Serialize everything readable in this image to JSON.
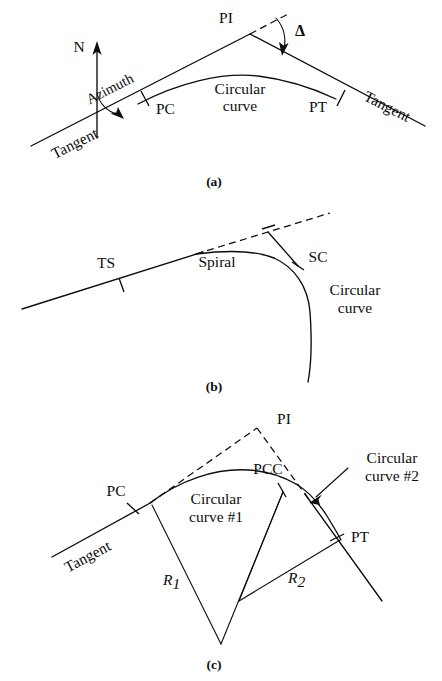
{
  "figure": {
    "ink_color": "#0d0d0d",
    "background_color": "#ffffff",
    "panels": [
      {
        "id": "a",
        "caption": "(a)",
        "description": "Simple circular curve with back tangent, forward tangent, azimuth from north, and deflection angle Delta at the PI",
        "labels": {
          "north": "N",
          "azimuth": "Azimuth",
          "tangent_back": "Tangent",
          "tangent_forward": "Tangent",
          "pc": "PC",
          "pi": "PI",
          "pt": "PT",
          "delta": "Δ",
          "curve_line1": "Circular",
          "curve_line2": "curve"
        }
      },
      {
        "id": "b",
        "caption": "(b)",
        "description": "Spiral transition curve from tangent to circular curve, with TS and SC points",
        "labels": {
          "ts": "TS",
          "spiral": "Spiral",
          "sc": "SC",
          "curve_line1": "Circular",
          "curve_line2": "curve"
        }
      },
      {
        "id": "c",
        "caption": "(c)",
        "description": "Compound circular curve with two radii R1 and R2 joined at the PCC",
        "labels": {
          "tangent": "Tangent",
          "pc": "PC",
          "pi": "PI",
          "pcc": "PCC",
          "pt": "PT",
          "curve1_line1": "Circular",
          "curve1_line2": "curve #1",
          "curve2_line1": "Circular",
          "curve2_line2": "curve #2",
          "radius1": "R",
          "radius1_sub": "1",
          "radius2": "R",
          "radius2_sub": "2"
        }
      }
    ]
  }
}
